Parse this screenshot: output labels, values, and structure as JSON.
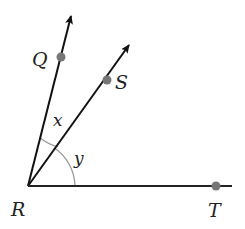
{
  "diagram": {
    "vertex": {
      "label": "R",
      "x": 28,
      "y": 186
    },
    "rays": [
      {
        "id": "RQ",
        "end": {
          "x": 71,
          "y": 15
        },
        "arrow": true,
        "point": {
          "label": "Q",
          "x": 61,
          "y": 57
        }
      },
      {
        "id": "RS",
        "end": {
          "x": 130,
          "y": 44
        },
        "arrow": true,
        "point": {
          "label": "S",
          "x": 107,
          "y": 80
        }
      },
      {
        "id": "RT",
        "end": {
          "x": 232,
          "y": 186
        },
        "arrow": false,
        "point": {
          "label": "T",
          "x": 216,
          "y": 186
        }
      }
    ],
    "angles": [
      {
        "label": "x",
        "between": [
          "RQ",
          "RS"
        ]
      },
      {
        "label": "y",
        "between": [
          "RS",
          "RT"
        ]
      }
    ],
    "colors": {
      "line": "#111111",
      "point": "#777777",
      "arc": "#999999"
    }
  },
  "labels": {
    "Q": "Q",
    "S": "S",
    "R": "R",
    "T": "T",
    "x": "x",
    "y": "y"
  }
}
